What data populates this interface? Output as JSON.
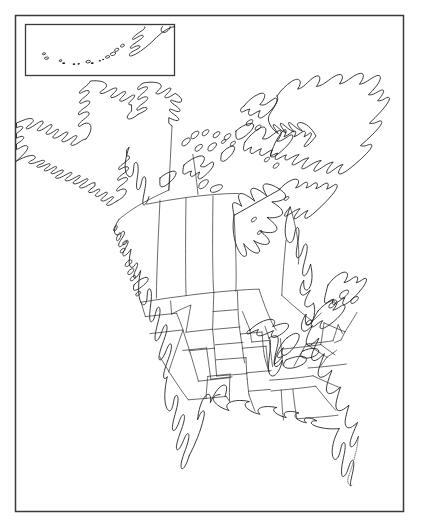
{
  "document": {
    "kind": "outline-map",
    "title": "North America Outline Map",
    "subject": "North America",
    "style": "blank line-art reference map, no labels",
    "background_color": "#ffffff",
    "line_color": "#1a1a1a",
    "frame_color": "#3a3a3a",
    "has_text_labels": false,
    "label_count": 0
  },
  "frame": {
    "outer": {
      "x": 15,
      "y": 15,
      "width": 389,
      "height": 497,
      "stroke": "#3a3a3a"
    }
  },
  "inset": {
    "name": "aleutian-islands-inset",
    "caption": "",
    "box": {
      "x": 25,
      "y": 24,
      "width": 150,
      "height": 52
    },
    "contents": "Aleutian Islands chain and Alaska Peninsula tip",
    "island_count": 14
  },
  "regions": [
    {
      "id": "alaska",
      "name": "Alaska",
      "type": "state",
      "outlined": true
    },
    {
      "id": "canada",
      "name": "Canada",
      "type": "country",
      "outlined": true
    },
    {
      "id": "greenland",
      "name": "Greenland",
      "type": "territory",
      "outlined": true
    },
    {
      "id": "united-states",
      "name": "United States",
      "type": "country",
      "outlined": true
    },
    {
      "id": "mexico",
      "name": "Mexico",
      "type": "country",
      "outlined": true
    }
  ],
  "features": [
    {
      "id": "hudson-bay",
      "name": "Hudson Bay",
      "type": "bay"
    },
    {
      "id": "great-lakes",
      "name": "Great Lakes",
      "type": "lakes"
    },
    {
      "id": "baja-california",
      "name": "Baja California",
      "type": "peninsula"
    },
    {
      "id": "florida-peninsula",
      "name": "Florida Peninsula",
      "type": "peninsula"
    },
    {
      "id": "arctic-archipelago",
      "name": "Canadian Arctic Archipelago",
      "type": "islands"
    },
    {
      "id": "newfoundland",
      "name": "Newfoundland",
      "type": "island"
    },
    {
      "id": "vancouver-island",
      "name": "Vancouver Island",
      "type": "island"
    },
    {
      "id": "gulf-of-mexico",
      "name": "Gulf of Mexico",
      "type": "gulf"
    },
    {
      "id": "aleutian-islands",
      "name": "Aleutian Islands",
      "type": "islands"
    }
  ],
  "boundaries": {
    "us_state_lines": true,
    "canadian_province_lines": true,
    "international_lines": true,
    "graticule": false
  }
}
